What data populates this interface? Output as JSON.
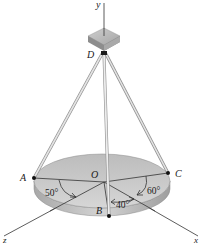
{
  "figure": {
    "axes": {
      "x": "x",
      "y": "y",
      "z": "z"
    },
    "points": {
      "A": "A",
      "B": "B",
      "C": "C",
      "D": "D",
      "O": "O"
    },
    "angles": {
      "angle_A_O_z": "50°",
      "angle_z_O_B": "40°",
      "angle_x_O_C": "60°"
    },
    "colors": {
      "disc_top": "#c8c8c8",
      "disc_edge": "#a9a9a9",
      "cable": "#d9d9d9",
      "block_top": "#bdbdbd",
      "block_side": "#9a9a9a",
      "ink": "#1a1a1a"
    }
  }
}
